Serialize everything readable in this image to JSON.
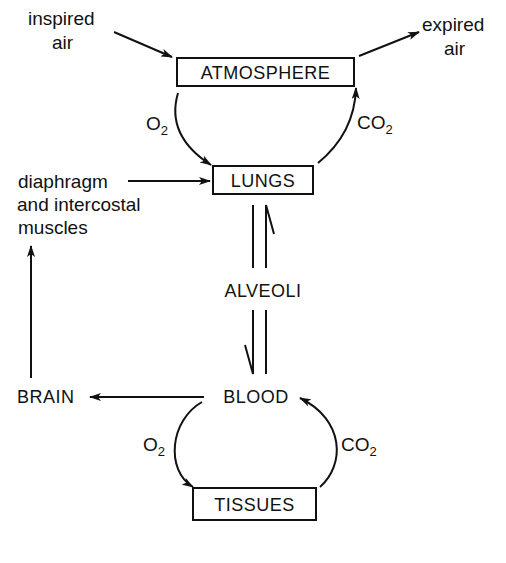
{
  "diagram": {
    "nodes": {
      "atmosphere": "ATMOSPHERE",
      "lungs": "LUNGS",
      "alveoli": "ALVEOLI",
      "blood": "BLOOD",
      "tissues": "TISSUES",
      "brain": "BRAIN"
    },
    "labels": {
      "inspired_1": "inspired",
      "inspired_2": "air",
      "expired_1": "expired",
      "expired_2": "air",
      "muscles_1": "diaphragm",
      "muscles_2": "and intercostal",
      "muscles_3": "muscles",
      "o2_top": "O",
      "o2_top_sub": "2",
      "co2_top": "CO",
      "co2_top_sub": "2",
      "o2_bottom": "O",
      "o2_bottom_sub": "2",
      "co2_bottom": "CO",
      "co2_bottom_sub": "2"
    },
    "edges": [
      {
        "from": "inspired air",
        "to": "ATMOSPHERE"
      },
      {
        "from": "ATMOSPHERE",
        "to": "expired air"
      },
      {
        "from": "ATMOSPHERE",
        "to": "LUNGS",
        "label": "O2"
      },
      {
        "from": "LUNGS",
        "to": "ATMOSPHERE",
        "label": "CO2"
      },
      {
        "from": "diaphragm and intercostal muscles",
        "to": "LUNGS"
      },
      {
        "from": "LUNGS",
        "to": "BLOOD",
        "via": "ALVEOLI"
      },
      {
        "from": "BLOOD",
        "to": "LUNGS",
        "via": "ALVEOLI"
      },
      {
        "from": "BLOOD",
        "to": "BRAIN"
      },
      {
        "from": "BRAIN",
        "to": "diaphragm and intercostal muscles"
      },
      {
        "from": "BLOOD",
        "to": "TISSUES",
        "label": "O2"
      },
      {
        "from": "TISSUES",
        "to": "BLOOD",
        "label": "CO2"
      }
    ]
  }
}
